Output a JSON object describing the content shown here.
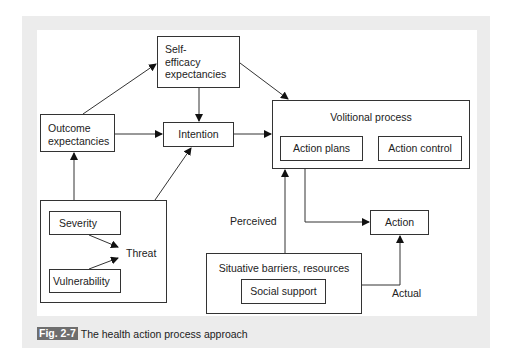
{
  "figure": {
    "badge": "Fig. 2-7",
    "caption": "The health action process approach",
    "colors": {
      "frame": "#ececec",
      "badge": "#6e6e6e",
      "line": "#333333"
    }
  },
  "nodes": {
    "self_efficacy": {
      "line1": "Self-",
      "line2": "efficacy",
      "line3": "expectancies"
    },
    "outcome": {
      "line1": "Outcome",
      "line2": "expectancies"
    },
    "intention": "Intention",
    "volitional": {
      "title": "Volitional process",
      "action_plans": "Action plans",
      "action_control": "Action control"
    },
    "threat_group": {
      "severity": "Severity",
      "vulnerability": "Vulnerability",
      "threat": "Threat"
    },
    "situative": {
      "title": "Situative barriers, resources",
      "social_support": "Social support"
    },
    "action": "Action"
  },
  "edge_labels": {
    "perceived": "Perceived",
    "actual": "Actual"
  }
}
